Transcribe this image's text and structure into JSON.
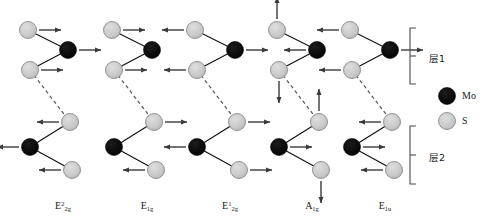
{
  "figure": {
    "type": "vibrational-mode-diagram",
    "material": "MoS2 bilayer",
    "atoms": {
      "mo": {
        "label": "Mo",
        "color": "#000000",
        "radius": 8.5
      },
      "s": {
        "label": "S",
        "color": "#c8c8c8",
        "radius": 8.5
      }
    },
    "legend": {
      "layer1_label": "层1",
      "layer2_label": "层2",
      "mo_label": "Mo",
      "s_label": "S"
    },
    "columns": [
      {
        "id": "e2g-2",
        "label_main": "E",
        "label_sup": "2",
        "label_sub": "2g",
        "description": "interlayer shear mode, S and Mo move in-plane, layers antiphase",
        "layer1": [
          {
            "atom": "s",
            "arrow": "right"
          },
          {
            "atom": "mo",
            "arrow": "right"
          },
          {
            "atom": "s",
            "arrow": "right"
          }
        ],
        "layer2": [
          {
            "atom": "s",
            "arrow": "left"
          },
          {
            "atom": "mo",
            "arrow": "left"
          },
          {
            "atom": "s",
            "arrow": "left"
          }
        ]
      },
      {
        "id": "e1g",
        "label_main": "E",
        "label_sup": "",
        "label_sub": "1g",
        "description": "S atoms move in-plane, Mo stationary, antiphase between layers",
        "layer1": [
          {
            "atom": "s",
            "arrow": "right"
          },
          {
            "atom": "mo",
            "arrow": "none"
          },
          {
            "atom": "s",
            "arrow": "right"
          }
        ],
        "layer2": [
          {
            "atom": "s",
            "arrow": "right"
          },
          {
            "atom": "mo",
            "arrow": "none"
          },
          {
            "atom": "s",
            "arrow": "left"
          }
        ]
      },
      {
        "id": "e2g-1",
        "label_main": "E",
        "label_sup": "1",
        "label_sub": "2g",
        "description": "S atoms move opposite to Mo, in-plane",
        "layer1": [
          {
            "atom": "s",
            "arrow": "left"
          },
          {
            "atom": "mo",
            "arrow": "right"
          },
          {
            "atom": "s",
            "arrow": "left"
          }
        ],
        "layer2": [
          {
            "atom": "s",
            "arrow": "right"
          },
          {
            "atom": "mo",
            "arrow": "left"
          },
          {
            "atom": "s",
            "arrow": "right"
          }
        ]
      },
      {
        "id": "a1g",
        "label_main": "A",
        "label_sup": "",
        "label_sub": "1g",
        "description": "out-of-plane breathing mode, S atoms move vertically, Mo in-plane",
        "layer1": [
          {
            "atom": "s",
            "arrow": "up"
          },
          {
            "atom": "mo",
            "arrow": "left"
          },
          {
            "atom": "s",
            "arrow": "down"
          }
        ],
        "layer2": [
          {
            "atom": "s",
            "arrow": "up"
          },
          {
            "atom": "mo",
            "arrow": "right"
          },
          {
            "atom": "s",
            "arrow": "down"
          }
        ]
      },
      {
        "id": "e1u",
        "label_main": "E",
        "label_sup": "",
        "label_sub": "1u",
        "description": "in-plane mode, S opposite Mo, layers in phase",
        "layer1": [
          {
            "atom": "s",
            "arrow": "left"
          },
          {
            "atom": "mo",
            "arrow": "right"
          },
          {
            "atom": "s",
            "arrow": "left"
          }
        ],
        "layer2": [
          {
            "atom": "s",
            "arrow": "left"
          },
          {
            "atom": "mo",
            "arrow": "right"
          },
          {
            "atom": "s",
            "arrow": "left"
          }
        ]
      }
    ]
  }
}
